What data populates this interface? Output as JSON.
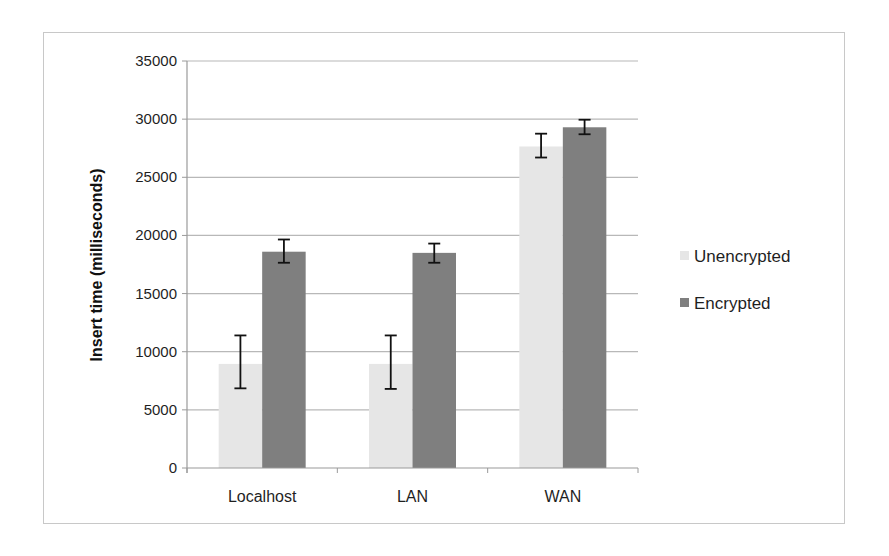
{
  "chart_data": {
    "type": "bar",
    "title": "",
    "xlabel": "",
    "ylabel": "Insert time (milliseconds)",
    "ylim": [
      0,
      35000
    ],
    "yticks": [
      0,
      5000,
      10000,
      15000,
      20000,
      25000,
      30000,
      35000
    ],
    "grid": true,
    "legend_position": "right",
    "categories": [
      "Localhost",
      "LAN",
      "WAN"
    ],
    "series": [
      {
        "name": "Unencrypted",
        "color": "#e6e6e6",
        "values": [
          8950,
          8950,
          27650
        ],
        "error_low": [
          6850,
          6800,
          26700
        ],
        "error_high": [
          11400,
          11400,
          28750
        ]
      },
      {
        "name": "Encrypted",
        "color": "#7f7f7f",
        "values": [
          18600,
          18500,
          29300
        ],
        "error_low": [
          17650,
          17650,
          28700
        ],
        "error_high": [
          19650,
          19300,
          29950
        ]
      }
    ]
  },
  "legend": {
    "items": [
      {
        "label": "Unencrypted",
        "color": "#e6e6e6"
      },
      {
        "label": "Encrypted",
        "color": "#7f7f7f"
      }
    ]
  },
  "axes": {
    "y_title": "Insert time (milliseconds)"
  }
}
